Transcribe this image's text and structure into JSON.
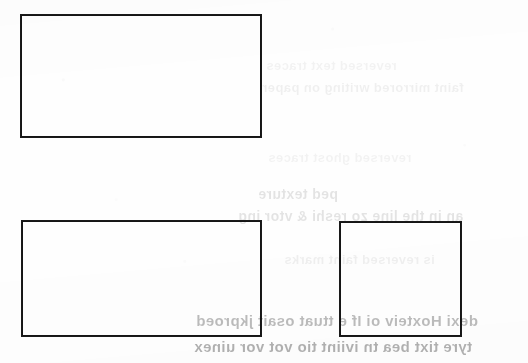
{
  "page": {
    "kind": "scanned-document-page",
    "width": 528,
    "height": 363,
    "background_color": "#fefefe",
    "ink_color": "#1a1a1a"
  },
  "boxes": [
    {
      "name": "top-left-blank-box",
      "label": "",
      "x": 20,
      "y": 14,
      "width": 242,
      "height": 124
    },
    {
      "name": "bottom-left-blank-box",
      "label": "",
      "x": 21,
      "y": 220,
      "width": 241,
      "height": 117
    },
    {
      "name": "bottom-right-blank-box",
      "label": "",
      "x": 339,
      "y": 221,
      "width": 123,
      "height": 116
    }
  ],
  "bleed_through_text": {
    "note": "Mirrored show-through from the reverse of the sheet; only partially legible",
    "lines": [
      {
        "id": "l1",
        "text": "reversed text traces",
        "x": 266,
        "y": 58,
        "tone": "faint"
      },
      {
        "id": "l2",
        "text": "faint mirrored writing on paper",
        "x": 262,
        "y": 80,
        "tone": "faint2"
      },
      {
        "id": "l3",
        "text": "reversed ghost traces",
        "x": 268,
        "y": 150,
        "tone": "faint"
      },
      {
        "id": "l4",
        "text": "ped texture",
        "x": 258,
        "y": 186,
        "tone": "mid"
      },
      {
        "id": "l5",
        "text": "an in the line zo reshi & vtor ing",
        "x": 238,
        "y": 208,
        "tone": "mid"
      },
      {
        "id": "l6",
        "text": "is reversed faint marks",
        "x": 284,
        "y": 252,
        "tone": "faint2"
      },
      {
        "id": "l7",
        "text": "dexi Hoxteiv oi If e ttuat  osait jkproed",
        "x": 196,
        "y": 312,
        "tone": "strong"
      },
      {
        "id": "l8",
        "text": "tyre tixt bea tn iviint tio  vot vor uinex",
        "x": 194,
        "y": 338,
        "tone": "strong2"
      }
    ]
  }
}
